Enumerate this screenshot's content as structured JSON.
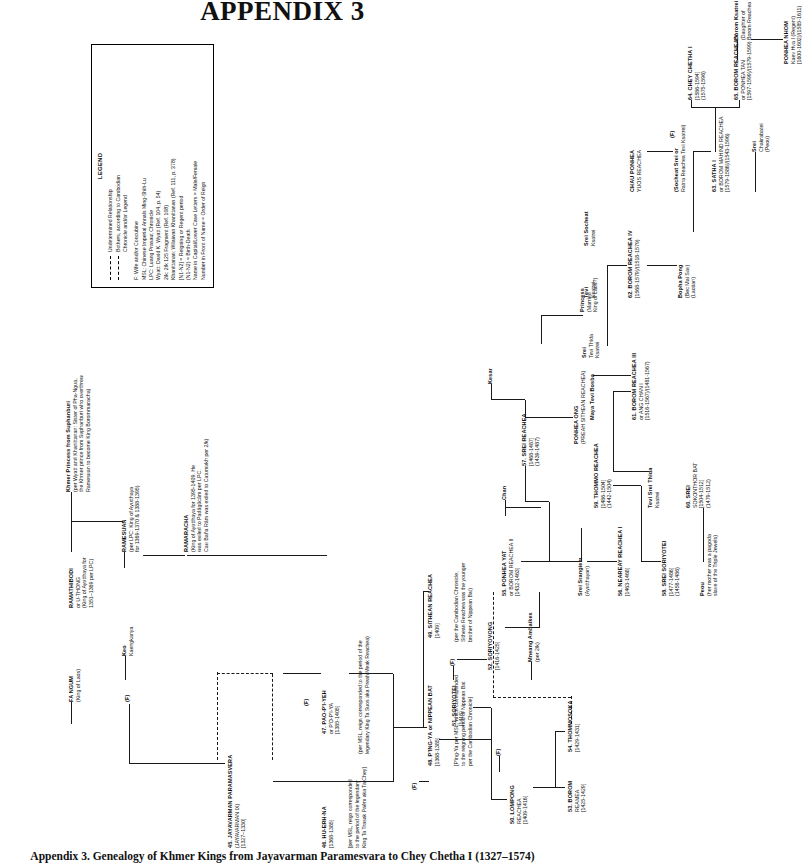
{
  "page": {
    "title": "APPENDIX 3",
    "caption": "Appendix 3. Genealogy of Khmer Kings from Jayavarman Paramesvara to Chey Chetha I (1327–1574)"
  },
  "legend": {
    "heading": "LEGEND",
    "symbols": [
      {
        "key": "dashed-line",
        "text": "Undetermined Relationship"
      },
      {
        "key": "dash-dot-line",
        "text": "Bothers, according to Cambodian\nChronicle and/or Legend"
      }
    ],
    "abbreviations": [
      "F: Wife and/or Concubine",
      "MSL: Chinese Imperial Annals Ming-Shih-Lu",
      "LPC: Luang Prasaut Chronicle",
      "Wyatt: David K. Wyatt (Ref. 104, p. 54)",
      "2/k: 2/k 125 Fragment (Ref. 108)",
      "Khanittanan: Wilaiwan Khanittanan (Ref. 111, p. 378)",
      "[N1-N2] = Reigning or Regent period",
      "(N1-N2) = Birth-Death",
      "Name in Capital/Lower Case Letters = Male/Female",
      "Number in Front of Name = Order of Reign"
    ]
  },
  "nodes": [
    {
      "id": "n45",
      "name": "45. JAYAVARMAN  PARAMASVERA",
      "lines": [
        "(JAYAVARMAN  IX)",
        "[1327–1330]"
      ]
    },
    {
      "id": "n46",
      "name": "46. HU-ERH-NA",
      "lines": [
        "[1368-1385]"
      ],
      "note": "[per MSL, reign corresponded\nto the period of the legendary\nKing Ta Trasak Paêm aka Ta Chey]"
    },
    {
      "id": "n47",
      "name": "47. PAO-P'I-YEH",
      "lines": [
        "or P'O-P'I-YA",
        "[1385-1405]"
      ],
      "note": "(per MSL, reign corresponded  to the period of the\nlegendary King Ta Suos aka Preah Meak Reachea)"
    },
    {
      "id": "n48",
      "name": "48. P'ING-YA or NIPPEAN  BAT",
      "lines": [
        "[1368-1385]"
      ],
      "note": "[P'ing-Ya per MSL, which corresponded\nto the reigning period of Nippean Bat\nper the Cambodian Chronicle]"
    },
    {
      "id": "n49",
      "name": "49. SITHEAN REACHEA",
      "lines": [
        "[1409]"
      ],
      "note": "(per  the  Cambodian  Chronicle,\nSithean Reachea was the younger\nbrother of Nippean Bat)"
    },
    {
      "id": "n50",
      "name": "50. LOMPONG",
      "lines": [
        "REACHEA",
        "[1409-1416]"
      ]
    },
    {
      "id": "n51",
      "name": "51. SORIYOTEI",
      "lines": [
        "[1416]"
      ]
    },
    {
      "id": "n52",
      "name": "52. SORIYOVONG",
      "lines": [
        "[1416-1425]"
      ]
    },
    {
      "id": "n53",
      "name": "53. BOROM",
      "lines": [
        "REAMEA",
        "[1425-1429]"
      ]
    },
    {
      "id": "n54",
      "name": "54. THOMMOSOKA",
      "lines": [
        "[1429-1431]"
      ]
    },
    {
      "id": "n55",
      "name": "55. PONHEA YAT",
      "lines": [
        "or BOROM REACHEA II",
        "[1432-1463]"
      ]
    },
    {
      "id": "n56",
      "name": "56. NEAREAY REACHEA I",
      "lines": [
        "[1463-1468]"
      ]
    },
    {
      "id": "n57",
      "name": "57. SREI REACHEA",
      "lines": [
        "[1468-1487]",
        "(1439-1487)"
      ]
    },
    {
      "id": "n58",
      "name": "58. SREI SORIYOTEI",
      "lines": [
        "[1477-1486]",
        "(1458-1486)"
      ]
    },
    {
      "id": "n59",
      "name": "59. THOMMO REACHEA",
      "lines": [
        "[1486-1504]",
        "(1442-1504)"
      ]
    },
    {
      "id": "n60",
      "name": "60. SREI",
      "lines": [
        "SOKONTHOR  BAT",
        "[1504-1512]",
        "(1479-1512)"
      ]
    },
    {
      "id": "n61",
      "name": "61. BOROM REACHEA III",
      "lines": [
        "or ANG  CHAN  I",
        "[1516-1567]/(1481-1567)"
      ]
    },
    {
      "id": "n62",
      "name": "62. BOROM REACHEA IV",
      "lines": [
        "[1568-1579]/(1518-1579)"
      ]
    },
    {
      "id": "n63",
      "name": "63. SATHA  I",
      "lines": [
        "or BOROM MAHIND  REACHEA",
        "[1579-1586]/(1543-1596)"
      ]
    },
    {
      "id": "n64",
      "name": "64. CHEY CHETHA I",
      "lines": [
        "[1586-1594]",
        "(1575-1596)"
      ]
    },
    {
      "id": "n65",
      "name": "65. BOROM REACHEA V",
      "lines": [
        "or PONHEA  TAN",
        "[1597-1599]/(1579-1599)"
      ]
    }
  ],
  "consorts": [
    {
      "id": "faf",
      "label": "(F)"
    },
    {
      "id": "fangum",
      "name": "FA NGUM",
      "lines": [
        "(King of Laos)"
      ]
    },
    {
      "id": "keo",
      "name": "Keo",
      "lines": [
        "Kaengkanya"
      ]
    },
    {
      "id": "ramathibodi",
      "name": "RAMATHIBODI",
      "lines": [
        "or U-THONG",
        "(King of Ayutthaya for",
        "1351–1369 per LPC)"
      ]
    },
    {
      "id": "khmerprincess",
      "name": "Khmer  Princess from Suphanburi",
      "lines": [
        "(per Wyatt and Khanittanan: Sister of Pha-Ngua,",
        "the Khmer prince from Suphanburi  who overthrew",
        "Ramesuan to become King Borommaracha)"
      ]
    },
    {
      "id": "ramesuan",
      "name": "RAMESUAN",
      "lines": [
        "(per LPC: King of Ayutthaya",
        "for 1369-1370 & 1388-1395)"
      ]
    },
    {
      "id": "ramaracha",
      "name": "RAMARACHA",
      "lines": [
        "(King of Ayutthaya for 1395-1409. He",
        "was exiled to Padâgûcâm per LPC.",
        "Cau Baña Râm was exiled to Catumukh per 2/k)"
      ]
    },
    {
      "id": "mneang",
      "name": "Mneang Ambaikes",
      "lines": [
        "(per 2/k)"
      ]
    },
    {
      "id": "chan",
      "name": "Chan",
      "lines": []
    },
    {
      "id": "kesar",
      "name": "Kesar",
      "lines": []
    },
    {
      "id": "ponheaong",
      "name": "PONHEA  ONG",
      "lines": [
        "(PREAH SITHEAN REACHEA)"
      ]
    },
    {
      "id": "sreisrangiem",
      "name": "Srei Srangiem",
      "lines": [
        "(Ayutthayan)"
      ]
    },
    {
      "id": "tevisreithida",
      "name": "Tevi Srei Thida",
      "lines": [
        "Ksatrei"
      ]
    },
    {
      "id": "sreitevithida",
      "name": "Srei",
      "lines": [
        "Tevi Thida",
        "Ksatrei"
      ]
    },
    {
      "id": "princess",
      "name": "Princess",
      "lines": [
        "(Married",
        "King of Laos?)"
      ]
    },
    {
      "id": "mayatevibosba",
      "name": "Maya Tevi Bosba",
      "lines": []
    },
    {
      "id": "tevisocheat",
      "name": "Tevi",
      "lines": [
        "Ksatrei"
      ]
    },
    {
      "id": "sreisocheat",
      "name": "Srei Socheat",
      "lines": [
        "Ksatrei"
      ]
    },
    {
      "id": "peou",
      "name": "Peou",
      "lines": [
        "(her mother  was a pagoda",
        "slave of the Triple Jewels)"
      ]
    },
    {
      "id": "chauponhea",
      "name": "CHAU PONHEA",
      "lines": [
        "YUOS REACHEA"
      ]
    },
    {
      "id": "socheatsrei",
      "name": "(Socheat Srei or",
      "lines": [
        "Ratna Reachea Tevi Ksatrei)"
      ]
    },
    {
      "id": "sreichakrabatei",
      "name": "Srei",
      "lines": [
        "Chakrabatei",
        "(Peou)"
      ]
    },
    {
      "id": "bophapong",
      "name": "Bopha Pong",
      "lines": [
        "(Bec Mai Sav)",
        "(Laotian)"
      ]
    },
    {
      "id": "boromksatrei",
      "name": "Borom Ksatrei",
      "lines": [
        "(Daughter of",
        "Borom Reachea VII)"
      ]
    },
    {
      "id": "ponheanhom",
      "name": "PONHEA  NHOM",
      "lines": [
        "Kaev Hva I (Regent)",
        "[1600-1602]/(1585-1611)"
      ]
    }
  ]
}
